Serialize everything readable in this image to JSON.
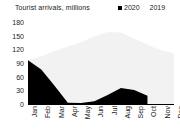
{
  "chart_data": {
    "type": "area",
    "title": "Tourist arrivals, millions",
    "xlabel": "",
    "ylabel": "",
    "ylim": [
      0,
      180
    ],
    "yticks": [
      180,
      150,
      120,
      90,
      60,
      30,
      0
    ],
    "grid": false,
    "legend_position": "top-right",
    "categories": [
      "Jan",
      "Feb",
      "Mar",
      "Apr",
      "May",
      "Jun",
      "Jul",
      "Aug",
      "Sep",
      "Oct",
      "Nov",
      "Dec"
    ],
    "series": [
      {
        "name": "2020",
        "color": "#000000",
        "values": [
          96,
          76,
          40,
          3,
          2,
          6,
          20,
          35,
          31,
          18,
          null,
          null
        ]
      },
      {
        "name": "2019",
        "color": "#f2f2f2",
        "values": [
          97,
          104,
          116,
          126,
          136,
          148,
          158,
          157,
          143,
          130,
          118,
          112
        ]
      }
    ]
  },
  "legend": {
    "entries": [
      {
        "label": "2020",
        "swatch": "black-square-marker"
      },
      {
        "label": "2019",
        "swatch": "white-area-marker"
      }
    ]
  }
}
